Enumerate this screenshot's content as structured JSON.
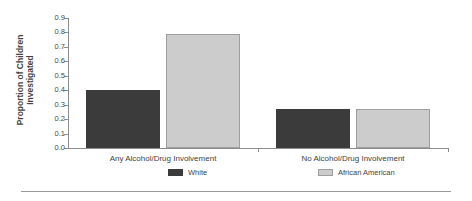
{
  "chart_data": {
    "type": "bar",
    "title": "",
    "xlabel": "",
    "ylabel": "Proportion of Children Investigated",
    "ylabel_lines": [
      "Proportion of Children",
      "Investigated"
    ],
    "categories": [
      "Any Alcohol/Drug Involvement",
      "No Alcohol/Drug Involvement"
    ],
    "series": [
      {
        "name": "White",
        "color": "#3b3b3b",
        "values": [
          0.4,
          0.27
        ]
      },
      {
        "name": "African American",
        "color": "#cccccc",
        "values": [
          0.79,
          0.27
        ]
      }
    ],
    "ylim": [
      0.0,
      0.9
    ],
    "ytick_labels": [
      "0.0",
      "0.1",
      "0.2",
      "0.3",
      "0.4",
      "0.5",
      "0.6",
      "0.7",
      "0.8",
      "0.9"
    ],
    "ytick_values": [
      0.0,
      0.1,
      0.2,
      0.3,
      0.4,
      0.5,
      0.6,
      0.7,
      0.8,
      0.9
    ],
    "grid": false,
    "legend_position": "bottom"
  }
}
